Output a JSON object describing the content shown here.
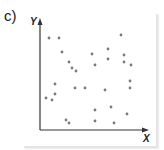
{
  "label": "c)",
  "chart_data": {
    "type": "scatter",
    "title": "",
    "xlabel": "X",
    "ylabel": "Y",
    "grid": false,
    "legend": null,
    "note": "No tick values shown; points in pixel coordinates (x right, y down) within 164x150 image",
    "points": [
      [
        49,
        38
      ],
      [
        59,
        38
      ],
      [
        62,
        52
      ],
      [
        69,
        62
      ],
      [
        72,
        68
      ],
      [
        76,
        71
      ],
      [
        55,
        84
      ],
      [
        55,
        94
      ],
      [
        46,
        98
      ],
      [
        52,
        100
      ],
      [
        75,
        88
      ],
      [
        85,
        88
      ],
      [
        66,
        120
      ],
      [
        69,
        123
      ],
      [
        92,
        54
      ],
      [
        95,
        65
      ],
      [
        95,
        121
      ],
      [
        95,
        110
      ],
      [
        108,
        49
      ],
      [
        108,
        59
      ],
      [
        121,
        35
      ],
      [
        124,
        55
      ],
      [
        124,
        62
      ],
      [
        131,
        65
      ],
      [
        130,
        81
      ],
      [
        130,
        88
      ],
      [
        105,
        90
      ],
      [
        111,
        107
      ],
      [
        114,
        123
      ],
      [
        127,
        114
      ]
    ],
    "colors": {
      "point": "#7a7a7a",
      "axis": "#333333"
    }
  }
}
